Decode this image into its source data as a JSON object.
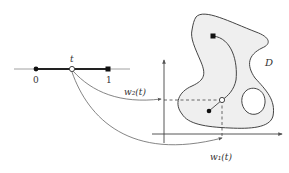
{
  "diagram": {
    "interval": {
      "left_label": "0",
      "right_label": "1",
      "param_label": "t"
    },
    "domain_label": "D",
    "maps": {
      "w1_label": "w₁(t)",
      "w2_label": "w₂(t)"
    },
    "colors": {
      "stroke": "#444444",
      "fill_domain": "#efefef",
      "interval_line": "#888888"
    }
  }
}
